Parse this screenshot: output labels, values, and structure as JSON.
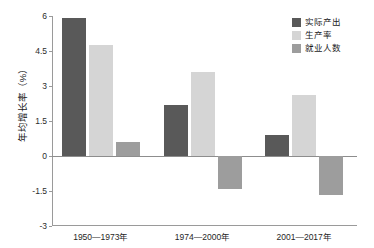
{
  "chart_data": {
    "type": "bar",
    "title": "",
    "subtitle": "",
    "xlabel": "",
    "ylabel": "年均增长率（%）",
    "categories": [
      "1950—1973年",
      "1974—2000年",
      "2001—2017年"
    ],
    "series": [
      {
        "name": "实际产出",
        "color": "#595959",
        "values": [
          5.9,
          2.2,
          0.9
        ]
      },
      {
        "name": "生产率",
        "color": "#d5d5d5",
        "values": [
          4.75,
          3.6,
          2.6
        ]
      },
      {
        "name": "就业人数",
        "color": "#9d9d9d",
        "values": [
          0.58,
          -1.4,
          -1.65
        ]
      }
    ],
    "ylim": [
      -3,
      6
    ],
    "yticks": [
      6,
      4.5,
      3,
      1.5,
      0,
      -1.5,
      -3
    ],
    "ytick_labels": [
      "6",
      "4.5",
      "3",
      "1.5",
      "0",
      "-1.5",
      "-3"
    ],
    "grid": false,
    "legend_position": "top-right",
    "zero_line": true
  },
  "legend": {
    "entries": [
      {
        "label": "实际产出"
      },
      {
        "label": "生产率"
      },
      {
        "label": "就业人数"
      }
    ]
  }
}
